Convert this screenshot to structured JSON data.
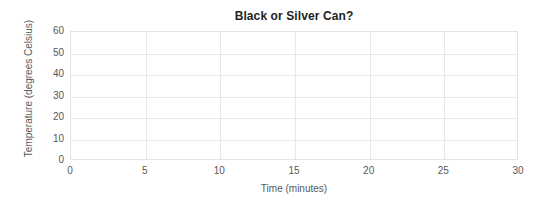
{
  "chart_data": {
    "type": "line",
    "title": "Black or Silver Can?",
    "xlabel": "Time (minutes)",
    "ylabel": "Temperature (degrees Celsius)",
    "xlim": [
      0,
      30
    ],
    "ylim": [
      0,
      60
    ],
    "xticks": [
      0,
      5,
      10,
      15,
      20,
      25,
      30
    ],
    "yticks": [
      0,
      10,
      20,
      30,
      40,
      50,
      60
    ],
    "xtick_labels": [
      "0",
      "5",
      "10",
      "15",
      "20",
      "25",
      "30"
    ],
    "ytick_labels": [
      "0",
      "10",
      "20",
      "30",
      "40",
      "50",
      "60"
    ],
    "grid": true,
    "grid_color": "#e8e8e8",
    "legend": null,
    "series": [],
    "annotations": [],
    "note": "Empty plotting template: axes, gridlines and labels only; no data plotted."
  },
  "colors": {
    "background": "#ffffff",
    "title_text": "#231f20",
    "label_text": "#58595b",
    "grid": "#e8e8e8",
    "axis_border": "#e3e3e3"
  }
}
